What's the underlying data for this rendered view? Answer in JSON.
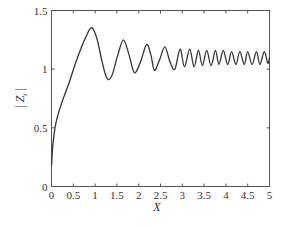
{
  "chart_data": {
    "type": "line",
    "title": "",
    "xlabel": "X",
    "ylabel": "|Z_t|",
    "xlim": [
      0,
      5
    ],
    "ylim": [
      0,
      1.5
    ],
    "grid": false,
    "legend": null,
    "xticks": [
      0,
      0.5,
      1,
      1.5,
      2,
      2.5,
      3,
      3.5,
      4,
      4.5,
      5
    ],
    "xtick_labels": [
      "0",
      "0.5",
      "1",
      "1.5",
      "2",
      "2.5",
      "3",
      "3.5",
      "4",
      "4.5",
      "5"
    ],
    "yticks": [
      0,
      0.5,
      1,
      1.5
    ],
    "ytick_labels": [
      "0",
      "0.5",
      "1",
      "1.5"
    ],
    "series": [
      {
        "name": "|Z_t|",
        "color": "#333333",
        "x": [
          0,
          0.03,
          0.08,
          0.14,
          0.25,
          0.4,
          0.55,
          0.7,
          0.82,
          0.9,
          0.96,
          1.05,
          1.15,
          1.24,
          1.31,
          1.4,
          1.52,
          1.65,
          1.78,
          1.9,
          2.04,
          2.18,
          2.28,
          2.36,
          2.48,
          2.6,
          2.72,
          2.83,
          2.95,
          3.05,
          3.17,
          3.27,
          3.37,
          3.46,
          3.56,
          3.66,
          3.76,
          3.84,
          3.94,
          4.04,
          4.13,
          4.23,
          4.32,
          4.42,
          4.5,
          4.6,
          4.7,
          4.78,
          4.88,
          4.96,
          5.0
        ],
        "y": [
          0.18,
          0.35,
          0.5,
          0.6,
          0.73,
          0.88,
          1.05,
          1.2,
          1.3,
          1.35,
          1.34,
          1.25,
          1.08,
          0.95,
          0.91,
          0.96,
          1.12,
          1.25,
          1.12,
          0.97,
          1.06,
          1.21,
          1.12,
          0.99,
          1.08,
          1.19,
          1.06,
          1.0,
          1.17,
          1.02,
          1.17,
          1.02,
          1.16,
          1.03,
          1.16,
          1.03,
          1.16,
          1.04,
          1.16,
          1.04,
          1.15,
          1.04,
          1.15,
          1.04,
          1.15,
          1.04,
          1.15,
          1.04,
          1.15,
          1.05,
          1.1
        ]
      }
    ]
  },
  "labels": {
    "xlabel": "X",
    "ylabel_bar_left": "|",
    "ylabel_main": "Z",
    "ylabel_sub": "t",
    "ylabel_bar_right": "|"
  }
}
